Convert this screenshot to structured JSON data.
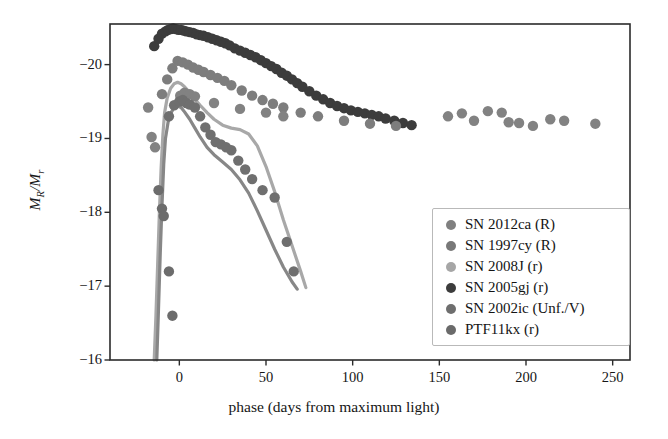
{
  "chart_data": {
    "type": "scatter",
    "title": "",
    "xlabel": "phase (days from maximum light)",
    "ylabel": "M_R/M_r",
    "ylabel_main": "M",
    "ylabel_sub1": "R",
    "ylabel_mid": "/M",
    "ylabel_sub2": "r",
    "xlim": [
      -40,
      260
    ],
    "ylim": [
      -16,
      -20.55
    ],
    "xticks": [
      0,
      50,
      100,
      150,
      200,
      250
    ],
    "xtick_labels": [
      "0",
      "50",
      "100",
      "150",
      "200",
      "250"
    ],
    "yticks": [
      -20,
      -19,
      -18,
      -17,
      -16
    ],
    "ytick_labels": [
      "−20",
      "−19",
      "−18",
      "−17",
      "−16"
    ],
    "grid": false,
    "legend_position": "lower right",
    "legend_entries": [
      {
        "label": "SN 2012ca (R)",
        "color": "#808080"
      },
      {
        "label": "SN 1997cy (R)",
        "color": "#787878"
      },
      {
        "label": "SN 2008J (r)",
        "color": "#a6a6a6"
      },
      {
        "label": "SN 2005gj (r)",
        "color": "#3c3c3c"
      },
      {
        "label": "SN 2002ic (Unf./V)",
        "color": "#6e6e6e"
      },
      {
        "label": "PTF11kx (r)",
        "color": "#6a6a6a"
      }
    ],
    "series": [
      {
        "name": "SN 2005gj (r)",
        "color": "#3c3c3c",
        "marker": "circle",
        "points": [
          [
            -14.5,
            -20.25
          ],
          [
            -12.0,
            -20.35
          ],
          [
            -10.0,
            -20.42
          ],
          [
            -8.0,
            -20.45
          ],
          [
            -6.5,
            -20.47
          ],
          [
            -5.0,
            -20.48
          ],
          [
            -3.5,
            -20.49
          ],
          [
            -2.0,
            -20.48
          ],
          [
            -0.5,
            -20.47
          ],
          [
            1.0,
            -20.47
          ],
          [
            2.5,
            -20.46
          ],
          [
            4.0,
            -20.45
          ],
          [
            6.0,
            -20.44
          ],
          [
            8.0,
            -20.43
          ],
          [
            10.0,
            -20.41
          ],
          [
            12.0,
            -20.4
          ],
          [
            14.0,
            -20.39
          ],
          [
            16.5,
            -20.37
          ],
          [
            19.0,
            -20.35
          ],
          [
            21.5,
            -20.33
          ],
          [
            24.0,
            -20.31
          ],
          [
            26.5,
            -20.29
          ],
          [
            29.0,
            -20.26
          ],
          [
            32.0,
            -20.22
          ],
          [
            35.0,
            -20.19
          ],
          [
            38.0,
            -20.16
          ],
          [
            41.0,
            -20.13
          ],
          [
            44.0,
            -20.1
          ],
          [
            47.0,
            -20.06
          ],
          [
            50.0,
            -20.02
          ],
          [
            53.0,
            -19.98
          ],
          [
            56.0,
            -19.94
          ],
          [
            59.0,
            -19.89
          ],
          [
            62.0,
            -19.85
          ],
          [
            65.0,
            -19.8
          ],
          [
            68.0,
            -19.75
          ],
          [
            71.0,
            -19.7
          ],
          [
            75.0,
            -19.64
          ],
          [
            79.0,
            -19.58
          ],
          [
            83.0,
            -19.53
          ],
          [
            87.0,
            -19.48
          ],
          [
            91.0,
            -19.44
          ],
          [
            95.0,
            -19.41
          ],
          [
            99.0,
            -19.38
          ],
          [
            103.0,
            -19.36
          ],
          [
            107.0,
            -19.34
          ],
          [
            111.0,
            -19.32
          ],
          [
            115.0,
            -19.3
          ],
          [
            119.0,
            -19.27
          ],
          [
            124.0,
            -19.24
          ],
          [
            129.0,
            -19.21
          ],
          [
            134.0,
            -19.18
          ]
        ]
      },
      {
        "name": "SN 1997cy (R)",
        "color": "#7d7d7d",
        "marker": "circle",
        "points": [
          [
            -10.0,
            -19.6
          ],
          [
            -7.0,
            -19.8
          ],
          [
            -4.0,
            -19.95
          ],
          [
            -1.0,
            -20.05
          ],
          [
            2.0,
            -20.03
          ],
          [
            5.0,
            -20.0
          ],
          [
            8.0,
            -19.96
          ],
          [
            11.0,
            -19.93
          ],
          [
            14.0,
            -19.9
          ],
          [
            18.0,
            -19.86
          ],
          [
            22.0,
            -19.82
          ],
          [
            26.0,
            -19.78
          ],
          [
            30.0,
            -19.72
          ],
          [
            36.0,
            -19.65
          ],
          [
            42.0,
            -19.58
          ],
          [
            48.0,
            -19.52
          ],
          [
            54.0,
            -19.47
          ],
          [
            60.0,
            -19.42
          ],
          [
            70.0,
            -19.35
          ],
          [
            80.0,
            -19.3
          ],
          [
            95.0,
            -19.24
          ],
          [
            110.0,
            -19.2
          ],
          [
            125.0,
            -19.17
          ]
        ]
      },
      {
        "name": "SN 2012ca (R)",
        "color": "#828282",
        "marker": "circle",
        "points": [
          [
            -18.0,
            -19.42
          ],
          [
            -16.0,
            -19.02
          ],
          [
            -14.0,
            -18.88
          ],
          [
            0.5,
            -19.58
          ],
          [
            3.0,
            -19.62
          ],
          [
            6.0,
            -19.6
          ],
          [
            9.0,
            -19.57
          ],
          [
            20.0,
            -19.48
          ],
          [
            35.0,
            -19.4
          ],
          [
            50.0,
            -19.35
          ],
          [
            60.0,
            -19.3
          ],
          [
            155.0,
            -19.3
          ],
          [
            163.0,
            -19.34
          ],
          [
            170.0,
            -19.24
          ],
          [
            178.0,
            -19.37
          ],
          [
            186.0,
            -19.35
          ],
          [
            190.0,
            -19.22
          ],
          [
            196.0,
            -19.21
          ],
          [
            204.0,
            -19.17
          ],
          [
            214.0,
            -19.26
          ],
          [
            222.0,
            -19.24
          ],
          [
            240.0,
            -19.2
          ]
        ]
      },
      {
        "name": "SN 2002ic (Unf./V)",
        "color": "#6f6f6f",
        "marker": "circle",
        "points": [
          [
            -6.0,
            -19.3
          ],
          [
            -3.0,
            -19.45
          ],
          [
            0.0,
            -19.5
          ],
          [
            2.0,
            -19.52
          ],
          [
            4.0,
            -19.48
          ],
          [
            6.0,
            -19.46
          ],
          [
            9.0,
            -19.42
          ],
          [
            12.0,
            -19.3
          ],
          [
            15.0,
            -19.15
          ],
          [
            18.0,
            -19.05
          ],
          [
            21.0,
            -18.95
          ],
          [
            24.0,
            -18.92
          ],
          [
            27.0,
            -18.88
          ],
          [
            30.0,
            -18.84
          ],
          [
            34.0,
            -18.7
          ],
          [
            38.0,
            -18.58
          ],
          [
            42.0,
            -18.45
          ],
          [
            48.0,
            -18.3
          ],
          [
            55.0,
            -18.2
          ],
          [
            62.0,
            -17.6
          ],
          [
            66.0,
            -17.2
          ]
        ]
      },
      {
        "name": "PTF11kx (r)",
        "color": "#6c6c6c",
        "marker": "circle",
        "points": [
          [
            -12.0,
            -18.3
          ],
          [
            -10.0,
            -18.05
          ],
          [
            -9.0,
            -17.95
          ],
          [
            -6.0,
            -17.2
          ],
          [
            -4.0,
            -16.6
          ]
        ]
      }
    ],
    "curves": [
      {
        "name": "SN 2008J (r)",
        "color": "#a8a8a8",
        "linewidth": 3.2,
        "points": [
          [
            -14.5,
            -16.0
          ],
          [
            -13.5,
            -16.6
          ],
          [
            -12.5,
            -17.3
          ],
          [
            -11.5,
            -18.0
          ],
          [
            -10.5,
            -18.6
          ],
          [
            -9.5,
            -19.05
          ],
          [
            -8.5,
            -19.35
          ],
          [
            -7.0,
            -19.55
          ],
          [
            -5.0,
            -19.68
          ],
          [
            -3.0,
            -19.74
          ],
          [
            -1.0,
            -19.76
          ],
          [
            1.0,
            -19.74
          ],
          [
            3.0,
            -19.7
          ],
          [
            6.0,
            -19.62
          ],
          [
            9.0,
            -19.53
          ],
          [
            12.0,
            -19.45
          ],
          [
            16.0,
            -19.35
          ],
          [
            20.0,
            -19.26
          ],
          [
            25.0,
            -19.18
          ],
          [
            30.0,
            -19.14
          ],
          [
            35.0,
            -19.12
          ],
          [
            40.0,
            -19.06
          ],
          [
            45.0,
            -18.9
          ],
          [
            50.0,
            -18.62
          ],
          [
            55.0,
            -18.28
          ],
          [
            60.0,
            -17.9
          ],
          [
            65.0,
            -17.55
          ],
          [
            70.0,
            -17.2
          ],
          [
            73.0,
            -16.98
          ]
        ]
      },
      {
        "name": "SN 2002ic model",
        "color": "#878787",
        "linewidth": 3.2,
        "points": [
          [
            -13.0,
            -16.0
          ],
          [
            -12.0,
            -16.7
          ],
          [
            -11.0,
            -17.45
          ],
          [
            -10.0,
            -18.1
          ],
          [
            -9.0,
            -18.65
          ],
          [
            -8.0,
            -19.0
          ],
          [
            -6.5,
            -19.22
          ],
          [
            -5.0,
            -19.34
          ],
          [
            -3.0,
            -19.42
          ],
          [
            -1.0,
            -19.44
          ],
          [
            1.0,
            -19.42
          ],
          [
            3.0,
            -19.36
          ],
          [
            6.0,
            -19.26
          ],
          [
            9.0,
            -19.14
          ],
          [
            12.0,
            -19.02
          ],
          [
            16.0,
            -18.88
          ],
          [
            20.0,
            -18.78
          ],
          [
            25.0,
            -18.68
          ],
          [
            30.0,
            -18.58
          ],
          [
            35.0,
            -18.44
          ],
          [
            40.0,
            -18.26
          ],
          [
            45.0,
            -18.02
          ],
          [
            50.0,
            -17.76
          ],
          [
            55.0,
            -17.5
          ],
          [
            60.0,
            -17.26
          ],
          [
            65.0,
            -17.06
          ],
          [
            68.0,
            -16.96
          ]
        ]
      }
    ]
  },
  "axes": {
    "frame_color": "#2b2b2b",
    "background": "#ffffff"
  }
}
